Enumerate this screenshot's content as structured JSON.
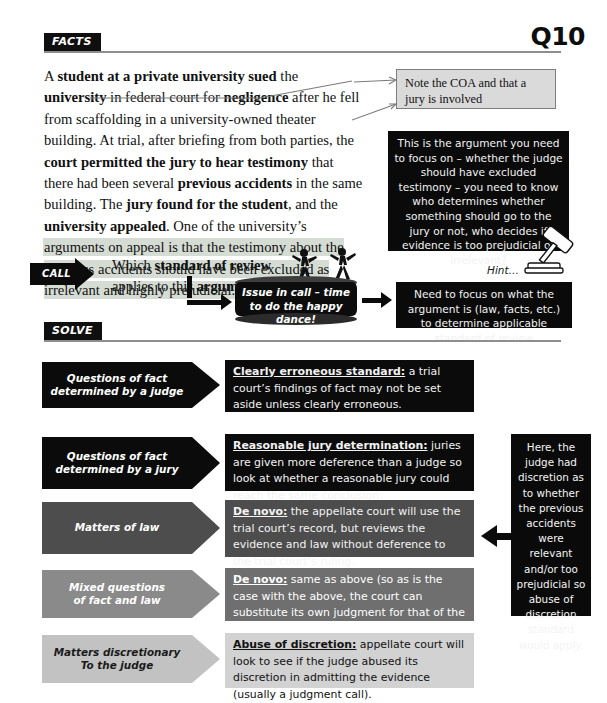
{
  "page": {
    "question_number": "Q10",
    "sections": {
      "facts_label": "FACTS",
      "solve_label": "SOLVE",
      "call_label": "CALL"
    }
  },
  "facts": {
    "paragraph_plain": "A student at a private university sued the university in federal court for negligence after he fell from scaffolding in a university-owned theater building. At trial, after briefing from both parties, the court permitted the jury to hear testimony that there had been several previous accidents in the same building. The jury found for the student, and the university appealed. One of the university's arguments on appeal is that the testimony about the previous accidents should have been excluded as irrelevant and highly prejudicial.",
    "note_box": "Note the COA and that a jury is involved",
    "black_callout": "This is the argument you need to focus on – whether the judge should have excluded testimony – you need to know who determines whether something should go to the jury or not, who decides if evidence is too prejudicial or irrelevant?",
    "hint_label": "Hint…",
    "hint_icon": "gavel-icon"
  },
  "call": {
    "question_plain": "Which standard of review applies to this argument?",
    "drum_text": "Issue in call – time to do the happy dance!",
    "right_callout": "Need to focus on what the argument is (law, facts, etc.) to determine applicable standard of review"
  },
  "solve": {
    "rows": [
      {
        "label": "Questions of fact determined by a judge",
        "label_line1": "Questions of fact",
        "label_line2": "determined by a judge",
        "term": "Clearly erroneous standard:",
        "definition": " a trial court’s findings of fact may not be set aside unless clearly erroneous.",
        "arrow_bg": "#0b0b0b",
        "arrow_fg": "#ffffff",
        "def_bg": "#0b0b0b",
        "def_fg": "#f2f2f2"
      },
      {
        "label": "Questions of fact determined by a jury",
        "label_line1": "Questions of fact",
        "label_line2": "determined by a jury",
        "term": "Reasonable jury determination:",
        "definition": " juries are given more deference than a judge so look at whether a reasonable jury could reach the same conclusion.",
        "arrow_bg": "#0b0b0b",
        "arrow_fg": "#ffffff",
        "def_bg": "#0b0b0b",
        "def_fg": "#f2f2f2"
      },
      {
        "label": "Matters of law",
        "label_line1": "Matters of law",
        "label_line2": "",
        "term": "De novo:",
        "definition": " the appellate court will use the trial court’s record, but reviews the evidence and law without deference to the trial court’s ruling.",
        "arrow_bg": "#4d4d4d",
        "arrow_fg": "#ffffff",
        "def_bg": "#4d4d4d",
        "def_fg": "#f4f4f4"
      },
      {
        "label": "Mixed questions of fact and law",
        "label_line1": "Mixed questions",
        "label_line2": "of fact and law",
        "term": "De novo:",
        "definition": " same as above (so as is the case with the above, the court can substitute its own judgment for that of the trial judge).",
        "arrow_bg": "#8a8a8a",
        "arrow_fg": "#ffffff",
        "def_bg": "#6f6f6f",
        "def_fg": "#ffffff"
      },
      {
        "label": "Matters discretionary To the judge",
        "label_line1": "Matters discretionary",
        "label_line2": "To the judge",
        "term": "Abuse of discretion:",
        "definition": " appellate court will look to see if the judge abused its discretion in admitting the evidence (usually a judgment call).",
        "arrow_bg": "#c2c2c2",
        "arrow_fg": "#1a1a1a",
        "def_bg": "#d2d2d2",
        "def_fg": "#111111"
      }
    ],
    "right_callout": "Here, the judge had discretion as to whether the previous accidents were relevant and/or too prejudicial so abuse of discretion standard would apply."
  },
  "colors": {
    "ink": "#0b0b0b",
    "rule": "#8e8e8e",
    "highlight": "#d5dcd4",
    "note_bg": "#dadada",
    "note_border": "#7d7d7d"
  }
}
